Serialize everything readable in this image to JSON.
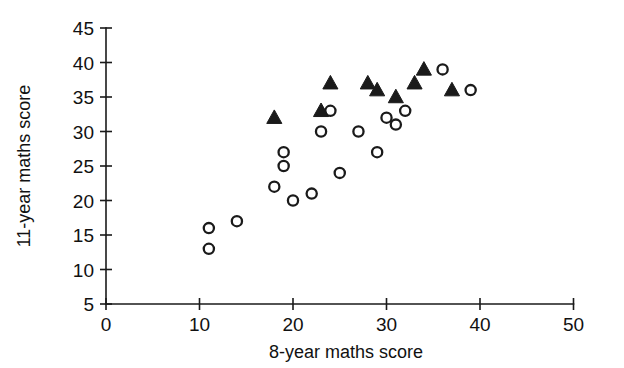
{
  "chart_data": {
    "type": "scatter",
    "title": "",
    "xlabel": "8-year maths score",
    "ylabel": "11-year maths score",
    "xlim": [
      0,
      50
    ],
    "ylim": [
      5,
      45
    ],
    "xticks": [
      0,
      10,
      20,
      30,
      40,
      50
    ],
    "yticks": [
      5,
      10,
      15,
      20,
      25,
      30,
      35,
      40,
      45
    ],
    "xtick_labels": [
      "0",
      "10",
      "20",
      "30",
      "40",
      "50"
    ],
    "ytick_labels": [
      "5",
      "10",
      "15",
      "20",
      "25",
      "30",
      "35",
      "40",
      "45"
    ],
    "grid": false,
    "legend": "none",
    "marker_color": "#1a1a1a",
    "series": [
      {
        "name": "open-circles",
        "marker": "open-circle",
        "points": [
          [
            11,
            16
          ],
          [
            11,
            13
          ],
          [
            14,
            17
          ],
          [
            18,
            22
          ],
          [
            19,
            27
          ],
          [
            19,
            25
          ],
          [
            20,
            20
          ],
          [
            22,
            21
          ],
          [
            23,
            30
          ],
          [
            24,
            33
          ],
          [
            25,
            24
          ],
          [
            27,
            30
          ],
          [
            29,
            27
          ],
          [
            30,
            32
          ],
          [
            31,
            31
          ],
          [
            32,
            33
          ],
          [
            36,
            39
          ],
          [
            39,
            36
          ]
        ]
      },
      {
        "name": "filled-triangles",
        "marker": "filled-triangle",
        "points": [
          [
            18,
            32
          ],
          [
            23,
            33
          ],
          [
            24,
            37
          ],
          [
            28,
            37
          ],
          [
            29,
            36
          ],
          [
            31,
            35
          ],
          [
            33,
            37
          ],
          [
            34,
            39
          ],
          [
            37,
            36
          ]
        ]
      }
    ]
  },
  "axes": {
    "x_title": "8-year maths score",
    "y_title": "11-year maths score"
  }
}
